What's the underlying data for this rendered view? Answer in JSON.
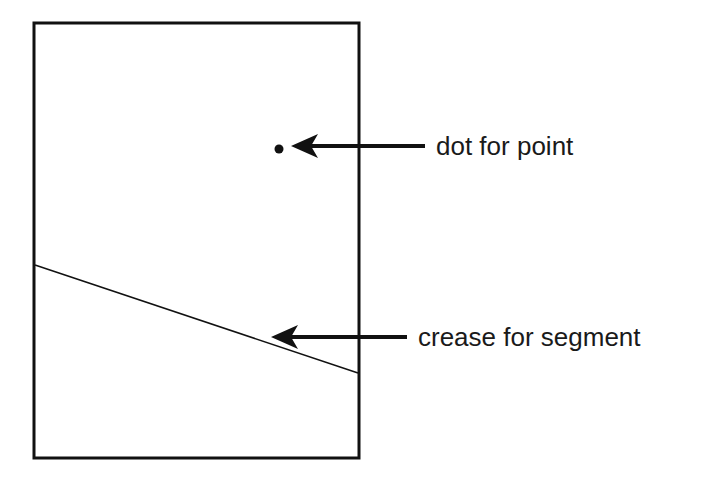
{
  "diagram": {
    "type": "paper-folding-illustration",
    "colors": {
      "ink": "#111111",
      "background": "#ffffff"
    },
    "paper": {
      "x": 34,
      "y": 23,
      "width": 325,
      "height": 435,
      "stroke_width": 3
    },
    "point": {
      "x": 279,
      "y": 149,
      "radius": 4.5
    },
    "crease": {
      "x1": 35,
      "y1": 265,
      "x2": 358,
      "y2": 373,
      "stroke_width": 1.5
    },
    "annotations": [
      {
        "id": "point-label",
        "text": "dot for point",
        "label_x": 436,
        "label_y": 134,
        "arrow": {
          "from_x": 425,
          "from_y": 146,
          "to_x": 293,
          "to_y": 146
        }
      },
      {
        "id": "segment-label",
        "text": "crease for segment",
        "label_x": 418,
        "label_y": 324,
        "arrow": {
          "from_x": 407,
          "from_y": 337,
          "to_x": 273,
          "to_y": 337
        }
      }
    ]
  }
}
